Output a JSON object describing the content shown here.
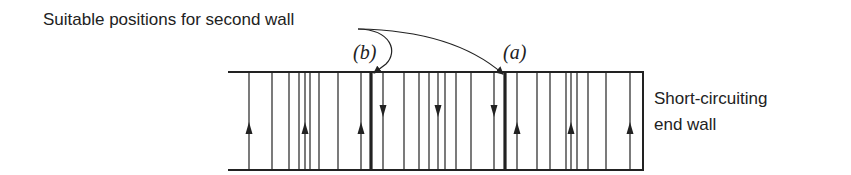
{
  "title_label": "Suitable positions for second wall",
  "end_wall_label": {
    "line1": "Short-circuiting",
    "line2": "end wall"
  },
  "position_labels": {
    "a": "(a)",
    "b": "(b)"
  },
  "colors": {
    "ink": "#222222",
    "background": "#ffffff"
  },
  "channel": {
    "x_start": 228,
    "x_end": 643,
    "top_y": 72,
    "bottom_y": 170
  },
  "field_lines": [
    {
      "x": 249,
      "arrow": "up"
    },
    {
      "x": 272,
      "arrow": "none"
    },
    {
      "x": 289,
      "arrow": "none"
    },
    {
      "x": 299,
      "arrow": "none"
    },
    {
      "x": 305,
      "arrow": "up"
    },
    {
      "x": 310,
      "arrow": "none"
    },
    {
      "x": 319,
      "arrow": "none"
    },
    {
      "x": 338,
      "arrow": "none"
    },
    {
      "x": 361,
      "arrow": "up"
    },
    {
      "x": 383,
      "arrow": "down"
    },
    {
      "x": 404,
      "arrow": "none"
    },
    {
      "x": 419,
      "arrow": "none"
    },
    {
      "x": 429,
      "arrow": "none"
    },
    {
      "x": 438,
      "arrow": "down"
    },
    {
      "x": 445,
      "arrow": "none"
    },
    {
      "x": 456,
      "arrow": "none"
    },
    {
      "x": 471,
      "arrow": "none"
    },
    {
      "x": 494,
      "arrow": "down"
    },
    {
      "x": 517,
      "arrow": "up"
    },
    {
      "x": 537,
      "arrow": "none"
    },
    {
      "x": 550,
      "arrow": "none"
    },
    {
      "x": 566,
      "arrow": "none"
    },
    {
      "x": 571,
      "arrow": "up"
    },
    {
      "x": 577,
      "arrow": "none"
    },
    {
      "x": 588,
      "arrow": "none"
    },
    {
      "x": 606,
      "arrow": "none"
    },
    {
      "x": 630,
      "arrow": "up"
    }
  ],
  "walls": [
    {
      "id": "b",
      "x": 371
    },
    {
      "id": "a",
      "x": 505
    },
    {
      "id": "end",
      "x": 643
    }
  ]
}
